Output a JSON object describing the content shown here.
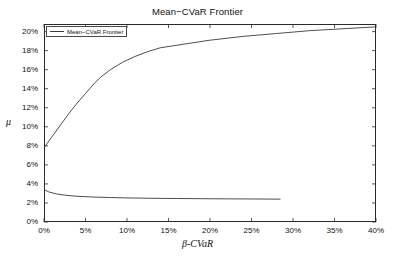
{
  "chart_data": {
    "type": "line",
    "title": "Mean−CVaR Frontier",
    "xlabel": "β-CVaR",
    "ylabel": "μ",
    "grid": false,
    "legend_position": "upper-left-inside",
    "xlim": [
      0,
      40
    ],
    "ylim": [
      0,
      20.8
    ],
    "x_tick_labels": [
      "0%",
      "5%",
      "10%",
      "15%",
      "20%",
      "25%",
      "30%",
      "35%",
      "40%"
    ],
    "x_tick_values": [
      0,
      5,
      10,
      15,
      20,
      25,
      30,
      35,
      40
    ],
    "y_tick_labels": [
      "0%",
      "2%",
      "4%",
      "6%",
      "8%",
      "10%",
      "12%",
      "14%",
      "16%",
      "18%",
      "20%"
    ],
    "y_tick_values": [
      0,
      2,
      4,
      6,
      8,
      10,
      12,
      14,
      16,
      18,
      20
    ],
    "units": "percent",
    "line_color": "#3a3a3a",
    "series": [
      {
        "name": "Mean−CVaR Frontier",
        "legend": true,
        "points": [
          [
            0.0,
            7.8
          ],
          [
            1.0,
            9.0
          ],
          [
            2.0,
            10.2
          ],
          [
            3.0,
            11.4
          ],
          [
            4.0,
            12.5
          ],
          [
            5.0,
            13.5
          ],
          [
            6.0,
            14.5
          ],
          [
            6.8,
            15.2
          ],
          [
            8.0,
            16.0
          ],
          [
            9.5,
            16.8
          ],
          [
            11.0,
            17.4
          ],
          [
            12.5,
            17.9
          ],
          [
            14.0,
            18.3
          ],
          [
            17.0,
            18.7
          ],
          [
            20.0,
            19.1
          ],
          [
            24.0,
            19.5
          ],
          [
            28.0,
            19.8
          ],
          [
            32.0,
            20.1
          ],
          [
            36.0,
            20.3
          ],
          [
            40.0,
            20.5
          ]
        ]
      },
      {
        "name": "lower-branch",
        "legend": false,
        "points": [
          [
            0.0,
            3.4
          ],
          [
            0.6,
            3.15
          ],
          [
            1.5,
            2.95
          ],
          [
            2.5,
            2.82
          ],
          [
            4.0,
            2.7
          ],
          [
            6.0,
            2.62
          ],
          [
            8.0,
            2.57
          ],
          [
            10.0,
            2.53
          ],
          [
            13.0,
            2.49
          ],
          [
            16.0,
            2.47
          ],
          [
            19.0,
            2.45
          ],
          [
            22.0,
            2.43
          ],
          [
            25.0,
            2.42
          ],
          [
            28.5,
            2.4
          ]
        ]
      }
    ]
  }
}
